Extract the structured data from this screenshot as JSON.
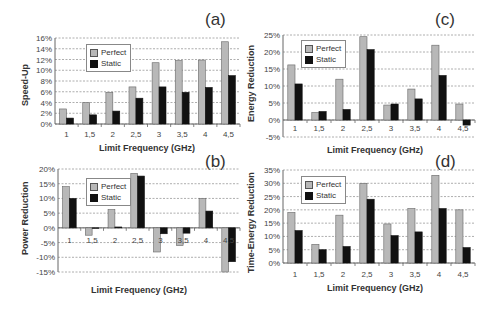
{
  "chart_data": [
    {
      "id": "a",
      "type": "bar",
      "panel_label": "(a)",
      "title": "",
      "xlabel": "Limit Frequency (GHz)",
      "ylabel": "Speed-Up",
      "categories": [
        "1",
        "1,5",
        "2",
        "2,5",
        "3",
        "3,5",
        "4",
        "4,5"
      ],
      "series": [
        {
          "name": "Perfect",
          "values": [
            2.8,
            4.0,
            5.9,
            6.9,
            11.4,
            11.8,
            11.9,
            15.3
          ]
        },
        {
          "name": "Static",
          "values": [
            1.1,
            1.7,
            2.4,
            4.8,
            6.9,
            5.9,
            6.8,
            9.0
          ]
        }
      ],
      "yticks": [
        "0%",
        "2%",
        "4%",
        "6%",
        "8%",
        "10%",
        "12%",
        "14%",
        "16%"
      ],
      "ylim": [
        0,
        16
      ],
      "grid": true,
      "legend_position": "upper-left"
    },
    {
      "id": "b",
      "type": "bar",
      "panel_label": "(b)",
      "title": "",
      "xlabel": "Limit Frequency (GHz)",
      "ylabel": "Power Reduction",
      "categories": [
        "1",
        "1,5",
        "2",
        "2,5",
        "3",
        "3,5",
        "4",
        "4,5"
      ],
      "series": [
        {
          "name": "Perfect",
          "values": [
            14.0,
            -2.5,
            6.2,
            18.5,
            -8.2,
            -6.0,
            10.0,
            -15.0
          ]
        },
        {
          "name": "Static",
          "values": [
            10.0,
            0.0,
            0.3,
            17.6,
            -2.0,
            -1.8,
            5.7,
            -11.5
          ]
        }
      ],
      "yticks": [
        "-15%",
        "-10%",
        "-5%",
        "0%",
        "5%",
        "10%",
        "15%",
        "20%"
      ],
      "ylim": [
        -15,
        20
      ],
      "grid": true,
      "legend_position": "upper-center"
    },
    {
      "id": "c",
      "type": "bar",
      "panel_label": "(c)",
      "title": "",
      "xlabel": "Limit Frequency (GHz)",
      "ylabel": "Energy Reduction",
      "categories": [
        "1",
        "1,5",
        "2",
        "2,5",
        "3",
        "3,5",
        "4",
        "4,5"
      ],
      "series": [
        {
          "name": "Perfect",
          "values": [
            16.2,
            2.2,
            12.0,
            24.5,
            4.4,
            9.1,
            22.0,
            4.7
          ]
        },
        {
          "name": "Static",
          "values": [
            10.6,
            2.5,
            3.1,
            20.7,
            4.7,
            6.2,
            13.1,
            -1.5
          ]
        }
      ],
      "yticks": [
        "-5%",
        "0%",
        "5%",
        "10%",
        "15%",
        "20%",
        "25%"
      ],
      "ylim": [
        -5,
        25
      ],
      "grid": true,
      "legend_position": "upper-left"
    },
    {
      "id": "d",
      "type": "bar",
      "panel_label": "(d)",
      "title": "",
      "xlabel": "Limit Frequency (GHz)",
      "ylabel": "Time-Energy Reduction",
      "categories": [
        "1",
        "1,5",
        "2",
        "2,5",
        "3",
        "3,5",
        "4",
        "4,5"
      ],
      "series": [
        {
          "name": "Perfect",
          "values": [
            19.0,
            7.0,
            18.0,
            30.0,
            14.7,
            20.5,
            33.0,
            20.0
          ]
        },
        {
          "name": "Static",
          "values": [
            12.2,
            5.0,
            6.2,
            24.0,
            10.3,
            11.7,
            20.5,
            5.8
          ]
        }
      ],
      "yticks": [
        "0%",
        "5%",
        "10%",
        "15%",
        "20%",
        "25%",
        "30%",
        "35%"
      ],
      "ylim": [
        0,
        35
      ],
      "grid": true,
      "legend_position": "upper-left"
    }
  ],
  "legend": {
    "perfect": "Perfect",
    "static": "Static"
  },
  "colors": {
    "perfect": "#b8b8b8",
    "static": "#111111",
    "grid": "#999999",
    "axis": "#666666"
  }
}
